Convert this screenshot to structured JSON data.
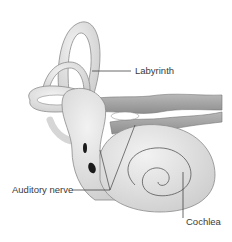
{
  "diagram": {
    "labels": {
      "labyrinth": "Labyrinth",
      "auditory_nerve": "Auditory nerve",
      "cochlea": "Cochlea"
    },
    "colors": {
      "structure_fill": "#dcdcdc",
      "structure_stroke": "#8a8a8a",
      "nerve_fill": "#a8a8a8",
      "leader_line": "#444444",
      "dark_spot": "#1a1a1a"
    }
  }
}
